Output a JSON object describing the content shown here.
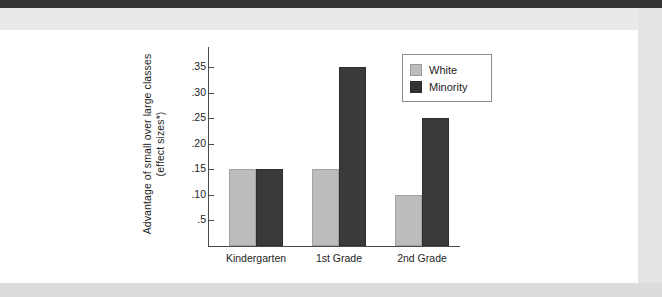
{
  "page": {
    "background_color": "#ffffff",
    "chrome_band_dark_color": "#343434",
    "chrome_band_light_color": "#e9e9e9"
  },
  "chart_data": {
    "type": "bar",
    "title": "",
    "subtitle": "",
    "xlabel": "",
    "ylabel_line1": "Advantage of small over large classes",
    "ylabel_line2": "(effect sizes*)",
    "categories": [
      "Kindergarten",
      "1st Grade",
      "2nd Grade"
    ],
    "series": [
      {
        "name": "White",
        "color": "#bcbcbc",
        "values": [
          0.15,
          0.15,
          0.1
        ]
      },
      {
        "name": "Minority",
        "color": "#3a3a3a",
        "values": [
          0.15,
          0.35,
          0.25
        ]
      }
    ],
    "ytick_values": [
      0.05,
      0.1,
      0.15,
      0.2,
      0.25,
      0.3,
      0.35
    ],
    "ytick_labels": [
      ".5",
      ".10",
      ".15",
      ".20",
      ".25",
      ".30",
      ".35"
    ],
    "ylim": [
      0,
      0.39
    ],
    "grid": false,
    "legend_position": "top-right",
    "legend_entries": [
      "White",
      "Minority"
    ]
  }
}
